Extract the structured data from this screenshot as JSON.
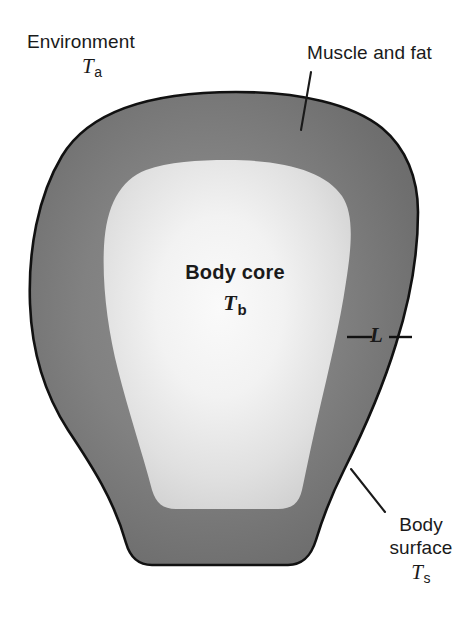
{
  "figure": {
    "type": "anatomical-heat-transfer-diagram",
    "background_color": "#ffffff",
    "outline_color": "#111111",
    "shell_color_outer": "#6b6b6b",
    "shell_color_inner": "#8a8a8a",
    "core_color_edge": "#cfcfcf",
    "core_color_center": "#f7f7f7",
    "leader_line_color": "#1a1a1a"
  },
  "labels": {
    "environment": {
      "text": "Environment",
      "symbol_letter": "T",
      "symbol_subscript": "a"
    },
    "muscle_and_fat": {
      "text": "Muscle and fat"
    },
    "body_core": {
      "text": "Body core",
      "symbol_letter": "T",
      "symbol_subscript": "b"
    },
    "thickness": {
      "text": "L"
    },
    "body_surface": {
      "line1": "Body",
      "line2": "surface",
      "symbol_letter": "T",
      "symbol_subscript": "s"
    }
  }
}
